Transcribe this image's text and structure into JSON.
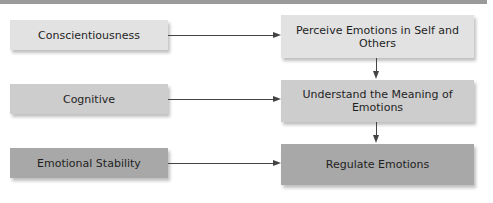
{
  "diagram": {
    "left_nodes": [
      {
        "label": "Conscientiousness",
        "color": "#e2e2e2"
      },
      {
        "label": "Cognitive",
        "color": "#cdcdcd"
      },
      {
        "label": "Emotional Stability",
        "color": "#a8a8a8"
      }
    ],
    "right_nodes": [
      {
        "label": "Perceive Emotions in Self and Others",
        "color": "#e2e2e2"
      },
      {
        "label": "Understand the Meaning of Emotions",
        "color": "#cdcdcd"
      },
      {
        "label": "Regulate Emotions",
        "color": "#a8a8a8"
      }
    ],
    "edges": [
      {
        "from": "Conscientiousness",
        "to": "Perceive Emotions in Self and Others"
      },
      {
        "from": "Cognitive",
        "to": "Understand the Meaning of Emotions"
      },
      {
        "from": "Emotional Stability",
        "to": "Regulate Emotions"
      },
      {
        "from": "Perceive Emotions in Self and Others",
        "to": "Understand the Meaning of Emotions"
      },
      {
        "from": "Understand the Meaning of Emotions",
        "to": "Regulate Emotions"
      }
    ]
  }
}
